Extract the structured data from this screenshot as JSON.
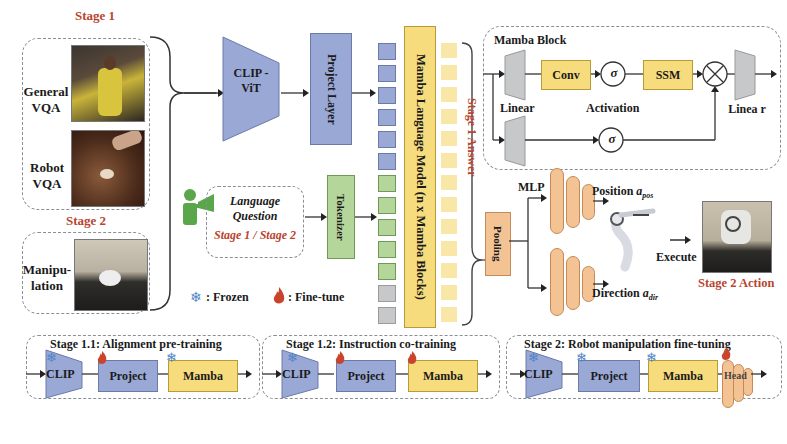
{
  "inputs": {
    "stage1_label": "Stage 1",
    "general_vqa": "General VQA",
    "robot_vqa": "Robot VQA",
    "stage2_label": "Stage 2",
    "manipulation": "Manipu- lation"
  },
  "encoder": {
    "clip_vit": "CLIP - ViT",
    "project_layer": "Project Layer",
    "tokenizer": "Tokenizer"
  },
  "language": {
    "title": "Language Question",
    "stages": "Stage 1 / Stage 2"
  },
  "legend": {
    "frozen": ": Frozen",
    "finetune": ": Fine-tune"
  },
  "llm": {
    "label": "Mamba Language Model (n x Mamba Blocks)",
    "answer": "Stage 1 Answer",
    "token_colors": [
      "blue",
      "blue",
      "blue",
      "blue",
      "blue",
      "blue",
      "green",
      "green",
      "green",
      "green",
      "green",
      "gray",
      "gray"
    ]
  },
  "mamba_block": {
    "title": "Mamba Block",
    "conv": "Conv",
    "ssm": "SSM",
    "sigma": "σ",
    "multiply": "⊗",
    "linear_left": "Linear",
    "activation": "Activation",
    "linear_right": "Linea r"
  },
  "head": {
    "pooling": "Pooling",
    "mlp": "MLP",
    "position": "Position",
    "position_sub": "a",
    "position_subscript": "pos",
    "direction": "Direction",
    "direction_sub": "a",
    "direction_subscript": "dir",
    "execute": "Execute",
    "stage2_action": "Stage 2 Action"
  },
  "training_stages": [
    {
      "title": "Stage 1.1: Alignment pre-training",
      "clip": "CLIP",
      "project": "Project",
      "mamba": "Mamba",
      "clip_state": "frozen",
      "project_state": "fine-tune",
      "mamba_state": "frozen"
    },
    {
      "title": "Stage 1.2: Instruction co-training",
      "clip": "CLIP",
      "project": "Project",
      "mamba": "Mamba",
      "clip_state": "frozen",
      "project_state": "fine-tune",
      "mamba_state": "fine-tune"
    },
    {
      "title": "Stage 2: Robot manipulation fine-tuning",
      "clip": "CLIP",
      "project": "Project",
      "mamba": "Mamba",
      "head": "Head",
      "clip_state": "frozen",
      "project_state": "frozen",
      "mamba_state": "frozen",
      "head_state": "fine-tune"
    }
  ],
  "colors": {
    "blue": "#9aa8d6",
    "yellow": "#f6dc7c",
    "green": "#b5d69b",
    "orange": "#f3c394",
    "gray": "#c7c8ca",
    "accent_red": "#b8452f",
    "person_green": "#5aa64a",
    "snow_blue": "#4f86c6"
  }
}
